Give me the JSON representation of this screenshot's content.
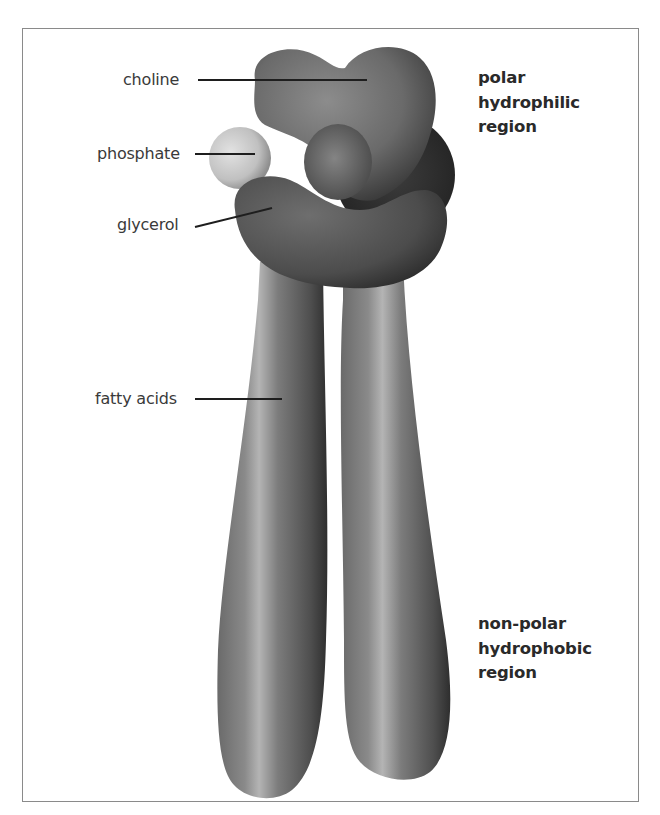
{
  "figure": {
    "parts": [
      {
        "id": "choline",
        "label": "choline"
      },
      {
        "id": "phosphate",
        "label": "phosphate"
      },
      {
        "id": "glycerol",
        "label": "glycerol"
      },
      {
        "id": "fatty-acids",
        "label": "fatty acids"
      }
    ],
    "regions": {
      "polar": {
        "lines": [
          "polar",
          "hydrophilic",
          "region"
        ]
      },
      "nonpolar": {
        "lines": [
          "non-polar",
          "hydrophobic",
          "region"
        ]
      }
    },
    "colors": {
      "frame_border": "#8a8a8a",
      "label_text": "#3a3a3a",
      "region_text": "#2a2a2a",
      "leader_line": "#1e1e1e",
      "molecule_dark": "#4a4a4a",
      "molecule_mid": "#7a7a7a",
      "phosphate_light": "#c8c8c8"
    }
  }
}
